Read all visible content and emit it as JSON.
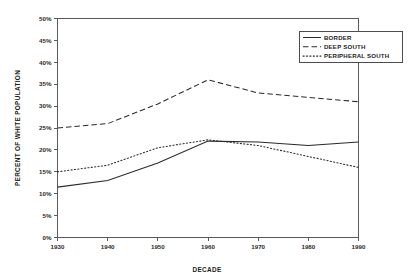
{
  "chart_data": {
    "type": "line",
    "title": "",
    "xlabel": "DECADE",
    "ylabel": "PERCENT OF WHITE POPULATION",
    "x": [
      1930,
      1940,
      1950,
      1960,
      1970,
      1980,
      1990
    ],
    "xtick_labels": [
      "1930",
      "1940",
      "1950",
      "1960",
      "1970",
      "1980",
      "1990"
    ],
    "xlim": [
      1930,
      1990
    ],
    "ylim": [
      0,
      50
    ],
    "ytick_labels": [
      "0%",
      "5%",
      "10%",
      "15%",
      "20%",
      "25%",
      "30%",
      "35%",
      "40%",
      "45%",
      "50%"
    ],
    "ytick_values": [
      0,
      5,
      10,
      15,
      20,
      25,
      30,
      35,
      40,
      45,
      50
    ],
    "grid": false,
    "legend_position": "top-right",
    "series": [
      {
        "name": "BORDER",
        "style": "solid",
        "color": "#2a2a2a",
        "values": [
          11.5,
          13.0,
          17.0,
          22.0,
          21.8,
          21.0,
          21.8
        ]
      },
      {
        "name": "DEEP SOUTH",
        "style": "dashed",
        "color": "#2a2a2a",
        "values": [
          25.0,
          26.0,
          30.5,
          36.0,
          33.0,
          32.0,
          31.0
        ]
      },
      {
        "name": "PERIPHERAL SOUTH",
        "style": "dotted",
        "color": "#2a2a2a",
        "values": [
          15.0,
          16.5,
          20.5,
          22.3,
          21.0,
          18.5,
          16.0
        ]
      }
    ]
  },
  "plot": {
    "axis_color": "#5a5a5a",
    "background": "#ffffff"
  }
}
